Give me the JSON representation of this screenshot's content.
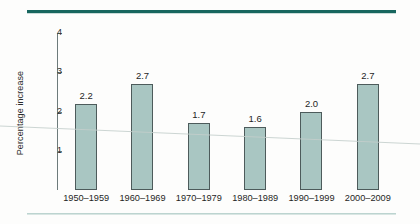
{
  "chart_data": {
    "type": "bar",
    "title": "",
    "subtitle": "",
    "xlabel": "",
    "ylabel": "Percentage increase",
    "categories": [
      "1950–1959",
      "1960–1969",
      "1970–1979",
      "1980–1989",
      "1990–1999",
      "2000–2009"
    ],
    "values": [
      2.2,
      2.7,
      1.7,
      1.6,
      2.0,
      2.7
    ],
    "value_labels": [
      "2.2",
      "2.7",
      "1.7",
      "1.6",
      "2.0",
      "2.7"
    ],
    "ylim": [
      0,
      4
    ],
    "ytick_values": [
      1,
      2,
      3,
      4
    ],
    "ytick_labels": [
      "1",
      "2",
      "3",
      "4"
    ],
    "grid": false,
    "legend": "none",
    "bar_fill_color": "#a9c6c2",
    "bar_border_color": "#4d5b5b",
    "axis_color": "#6d7b7b"
  },
  "decor": {
    "top_rule_color": "#17665e",
    "bottom_rule_color": "#bcd4d0"
  }
}
